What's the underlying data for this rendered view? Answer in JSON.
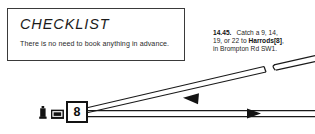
{
  "checklist": {
    "title": "CHECKLIST",
    "body": "There is no need to book anything in advance."
  },
  "annotation": {
    "time": "14.45.",
    "text_1": "Catch a 9, 14, 19, or 22 to ",
    "destination": "Harrods",
    "ref": "[8]",
    "text_2": ", in Brompton Rd SW1."
  },
  "stop_marker": {
    "number": "8"
  },
  "legend": {
    "icons": [
      {
        "name": "monument-icon",
        "title": "Monument"
      },
      {
        "name": "shop-icon",
        "title": "Shop"
      }
    ]
  },
  "routes": [
    {
      "name": "diagonal-route",
      "direction": "inbound",
      "arrow": "left",
      "has_break": true
    },
    {
      "name": "horizontal-route",
      "direction": "outbound",
      "arrow": "right",
      "has_break": false
    }
  ],
  "colors": {
    "ink": "#131313",
    "line": "#1a1a1a",
    "paper": "#ffffff",
    "text": "#262626"
  }
}
